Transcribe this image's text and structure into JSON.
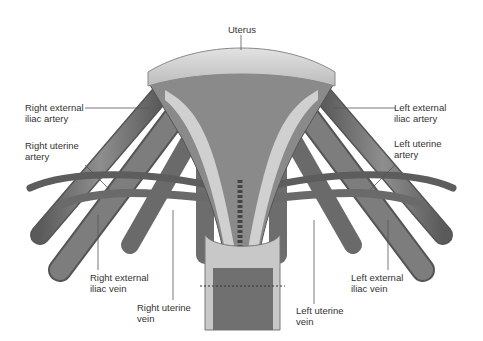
{
  "figure": {
    "labels": {
      "uterus": "Uterus",
      "right_ext_iliac_artery": "Right external\niliac artery",
      "right_uterine_artery": "Right uterine\nartery",
      "left_ext_iliac_artery": "Left external\niliac artery",
      "left_uterine_artery": "Left uterine\nartery",
      "right_ext_iliac_vein": "Right external\niliac vein",
      "right_uterine_vein": "Right uterine\nvein",
      "left_uterine_vein": "Left uterine\nvein",
      "left_ext_iliac_vein": "Left external\niliac vein"
    },
    "colors": {
      "background": "#ffffff",
      "tissue_light": "#d4d4d4",
      "tissue_mid": "#8a8a8a",
      "vessel": "#6e6e6e",
      "vessel_dark": "#4a4a4a",
      "leader_line": "#555555",
      "text": "#333333"
    }
  }
}
